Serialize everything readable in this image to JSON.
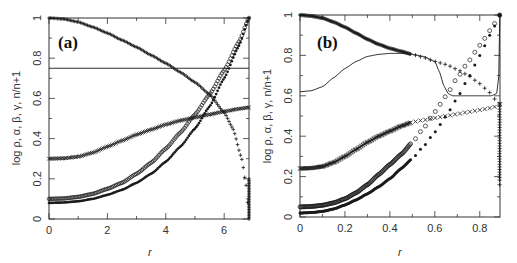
{
  "figure": {
    "background": "#ffffff",
    "ink": "#1a1a1a"
  },
  "chart_data": [
    {
      "type": "scatter",
      "panel_label": "(a)",
      "title": "",
      "xlabel": "r",
      "ylabel": "log ρ, α, β, γ, n/n+1",
      "xlim": [
        0,
        6.85
      ],
      "ylim": [
        0,
        1
      ],
      "xticks": [
        0,
        2,
        4,
        6
      ],
      "xtick_labels": [
        "0",
        "2",
        "4",
        "6"
      ],
      "yticks": [
        0,
        0.2,
        0.4,
        0.6,
        0.8,
        1
      ],
      "ytick_labels": [
        "0",
        "0.2",
        "0.4",
        "0.6",
        "0.8",
        "1"
      ],
      "grid": false,
      "legend": null,
      "frame_px": {
        "left": 49,
        "right": 249,
        "top": 18,
        "bottom": 219
      },
      "series": [
        {
          "name": "log rho",
          "marker": "plus",
          "style": "dense",
          "x": [
            0,
            0.5,
            1,
            1.5,
            2,
            2.5,
            3,
            3.5,
            4,
            4.5,
            5,
            5.5,
            6,
            6.3,
            6.6,
            6.75,
            6.85
          ],
          "y": [
            1.0,
            0.995,
            0.98,
            0.955,
            0.925,
            0.89,
            0.855,
            0.815,
            0.775,
            0.73,
            0.68,
            0.62,
            0.53,
            0.45,
            0.3,
            0.17,
            0.0
          ]
        },
        {
          "name": "n/n+1",
          "marker": "line",
          "style": "line",
          "x": [
            0,
            6.85
          ],
          "y": [
            0.75,
            0.75
          ]
        },
        {
          "name": "alpha",
          "marker": "x",
          "style": "dense",
          "x": [
            0,
            0.5,
            1,
            1.5,
            2,
            2.5,
            3,
            3.5,
            4,
            4.5,
            5,
            5.5,
            6,
            6.5,
            6.85
          ],
          "y": [
            0.3,
            0.302,
            0.31,
            0.33,
            0.36,
            0.39,
            0.42,
            0.445,
            0.47,
            0.49,
            0.505,
            0.52,
            0.535,
            0.548,
            0.555
          ]
        },
        {
          "name": "beta",
          "marker": "circle",
          "style": "dense",
          "x": [
            0,
            0.5,
            1,
            1.5,
            2,
            2.5,
            3,
            3.5,
            4,
            4.5,
            5,
            5.5,
            6,
            6.5,
            6.85
          ],
          "y": [
            0.1,
            0.102,
            0.11,
            0.125,
            0.15,
            0.18,
            0.225,
            0.28,
            0.35,
            0.43,
            0.52,
            0.62,
            0.74,
            0.88,
            1.0
          ]
        },
        {
          "name": "gamma",
          "marker": "star",
          "style": "dense",
          "x": [
            0,
            0.5,
            1,
            1.5,
            2,
            2.5,
            3,
            3.5,
            4,
            4.5,
            5,
            5.5,
            6,
            6.5,
            6.85
          ],
          "y": [
            0.08,
            0.082,
            0.088,
            0.1,
            0.12,
            0.145,
            0.18,
            0.225,
            0.285,
            0.36,
            0.45,
            0.56,
            0.7,
            0.86,
            1.0
          ]
        }
      ]
    },
    {
      "type": "scatter",
      "panel_label": "(b)",
      "title": "",
      "xlabel": "r",
      "ylabel": "log ρ, α, β, γ, n/n+1",
      "xlim": [
        0,
        0.89
      ],
      "ylim": [
        0,
        1
      ],
      "xticks": [
        0,
        0.2,
        0.4,
        0.6,
        0.8
      ],
      "xtick_labels": [
        "0",
        "0.2",
        "0.4",
        "0.6",
        "0.8"
      ],
      "yticks": [
        0,
        0.2,
        0.4,
        0.6,
        0.8,
        1
      ],
      "ytick_labels": [
        "0",
        "0.2",
        "0.4",
        "0.6",
        "0.8",
        "1"
      ],
      "grid": false,
      "legend": null,
      "frame_px": {
        "left": 300,
        "right": 500,
        "top": 15,
        "bottom": 217
      },
      "series": [
        {
          "name": "log rho",
          "marker": "plus",
          "style": "sparse-tail",
          "x": [
            0,
            0.05,
            0.1,
            0.15,
            0.2,
            0.25,
            0.3,
            0.35,
            0.4,
            0.45,
            0.5,
            0.55,
            0.6,
            0.65,
            0.7,
            0.75,
            0.8,
            0.84,
            0.87,
            0.88,
            0.885,
            0.888
          ],
          "y": [
            1.0,
            0.995,
            0.985,
            0.965,
            0.94,
            0.91,
            0.88,
            0.855,
            0.835,
            0.82,
            0.805,
            0.79,
            0.77,
            0.755,
            0.73,
            0.7,
            0.66,
            0.62,
            0.58,
            0.45,
            0.3,
            0.16
          ]
        },
        {
          "name": "n/n+1",
          "marker": "line",
          "style": "line",
          "x": [
            0,
            0.05,
            0.1,
            0.15,
            0.2,
            0.25,
            0.3,
            0.35,
            0.4,
            0.45,
            0.5,
            0.55,
            0.6,
            0.62,
            0.64,
            0.66,
            0.68,
            0.7,
            0.75,
            0.8,
            0.85,
            0.875,
            0.885,
            0.889
          ],
          "y": [
            0.62,
            0.625,
            0.645,
            0.69,
            0.735,
            0.77,
            0.795,
            0.805,
            0.81,
            0.81,
            0.805,
            0.795,
            0.77,
            0.72,
            0.65,
            0.61,
            0.6,
            0.6,
            0.6,
            0.6,
            0.6,
            0.61,
            0.7,
            1.0
          ]
        },
        {
          "name": "alpha",
          "marker": "x",
          "style": "sparse-tail",
          "x": [
            0,
            0.05,
            0.1,
            0.15,
            0.2,
            0.25,
            0.3,
            0.35,
            0.4,
            0.45,
            0.5,
            0.55,
            0.6,
            0.65,
            0.7,
            0.75,
            0.8,
            0.85,
            0.88,
            0.889
          ],
          "y": [
            0.24,
            0.242,
            0.25,
            0.27,
            0.3,
            0.335,
            0.37,
            0.4,
            0.425,
            0.45,
            0.47,
            0.48,
            0.49,
            0.5,
            0.51,
            0.52,
            0.53,
            0.54,
            0.55,
            0.56
          ]
        },
        {
          "name": "beta",
          "marker": "circle",
          "style": "sparse-tail",
          "x": [
            0,
            0.05,
            0.1,
            0.15,
            0.2,
            0.25,
            0.3,
            0.35,
            0.4,
            0.45,
            0.5,
            0.55,
            0.6,
            0.65,
            0.7,
            0.75,
            0.8,
            0.85,
            0.889
          ],
          "y": [
            0.05,
            0.052,
            0.058,
            0.07,
            0.09,
            0.12,
            0.16,
            0.21,
            0.26,
            0.31,
            0.37,
            0.44,
            0.52,
            0.6,
            0.69,
            0.77,
            0.85,
            0.93,
            1.0
          ]
        },
        {
          "name": "gamma",
          "marker": "star",
          "style": "sparse-tail",
          "x": [
            0,
            0.05,
            0.1,
            0.15,
            0.2,
            0.25,
            0.3,
            0.35,
            0.4,
            0.45,
            0.5,
            0.55,
            0.6,
            0.65,
            0.7,
            0.75,
            0.8,
            0.85,
            0.889
          ],
          "y": [
            0.02,
            0.022,
            0.028,
            0.04,
            0.06,
            0.085,
            0.115,
            0.15,
            0.19,
            0.24,
            0.29,
            0.35,
            0.42,
            0.5,
            0.59,
            0.69,
            0.8,
            0.91,
            1.0
          ]
        }
      ]
    }
  ]
}
